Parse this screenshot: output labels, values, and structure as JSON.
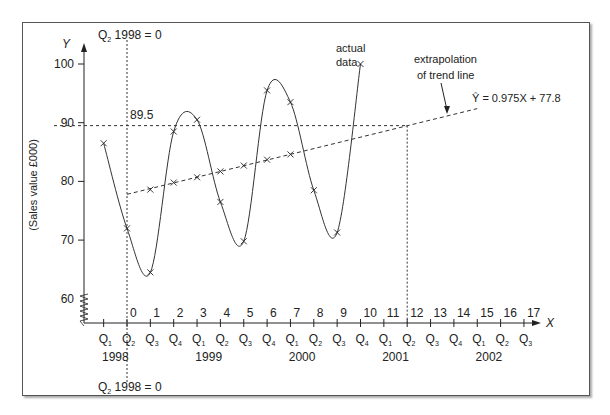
{
  "chart_data": {
    "type": "line",
    "title": "",
    "xlabel": "X",
    "ylabel": "Y",
    "y_axis_title": "(Sales value £000)",
    "ylim": [
      58,
      103
    ],
    "y_ticks": [
      60,
      70,
      80,
      90,
      100
    ],
    "x_ticks": [
      0,
      1,
      2,
      3,
      4,
      5,
      6,
      7,
      8,
      9,
      10,
      11,
      12,
      13,
      14,
      15,
      16,
      17
    ],
    "quarters": [
      "Q1",
      "Q2",
      "Q3",
      "Q4",
      "Q1",
      "Q2",
      "Q3",
      "Q4",
      "Q1",
      "Q2",
      "Q3",
      "Q4",
      "Q1",
      "Q2",
      "Q3",
      "Q4",
      "Q1",
      "Q2",
      "Q3"
    ],
    "years": [
      {
        "label": "1998",
        "at": -0.5
      },
      {
        "label": "1999",
        "at": 3.5
      },
      {
        "label": "2000",
        "at": 7.5
      },
      {
        "label": "2001",
        "at": 11.5
      },
      {
        "label": "2002",
        "at": 15.5
      }
    ],
    "series": [
      {
        "name": "actual data",
        "x": [
          -1,
          0,
          1,
          2,
          3,
          4,
          5,
          6,
          7,
          8,
          9,
          10
        ],
        "values": [
          86.5,
          72,
          64.5,
          88.5,
          90.5,
          76.5,
          69.8,
          95.5,
          93.5,
          78.5,
          71.3,
          100
        ]
      },
      {
        "name": "trend (moving average)",
        "x": [
          1,
          2,
          3,
          4,
          5,
          6,
          7
        ],
        "values": [
          78.6,
          79.8,
          80.7,
          81.7,
          82.7,
          83.7,
          84.6
        ]
      },
      {
        "name": "extrapolation of trend line",
        "equation": "Ŷ = 0.975X + 77.8",
        "x": [
          0,
          15
        ],
        "values": [
          77.8,
          92.4
        ]
      }
    ],
    "annotations": {
      "origin_note_top": "Q2 1998 = 0",
      "origin_note_bottom": "Q2 1998 = 0",
      "forecast_value": "89.5",
      "forecast_x": 12,
      "actual_label_1": "actual",
      "actual_label_2": "data",
      "extrap_label_1": "extrapolation",
      "extrap_label_2": "of trend line",
      "equation": "Ŷ = 0.975X + 77.8"
    },
    "grid": false
  }
}
